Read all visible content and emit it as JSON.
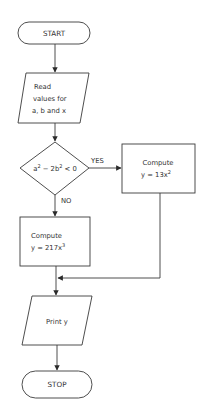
{
  "diagram": {
    "type": "flowchart",
    "stroke_color": "#3a3a3a",
    "background": "#ffffff",
    "nodes": {
      "start": {
        "shape": "terminal",
        "label": "START"
      },
      "read": {
        "shape": "input-output",
        "lines": [
          "Read",
          "values for",
          "a, b and x"
        ]
      },
      "decision": {
        "shape": "decision",
        "expr_a": "a",
        "sup_a": "2",
        "expr_mid": " − 2b",
        "sup_b": "2",
        "expr_end": " < 0"
      },
      "compute_yes": {
        "shape": "process",
        "line1": "Compute",
        "line2": "y = 13x",
        "sup": "2"
      },
      "compute_no": {
        "shape": "process",
        "line1": "Compute",
        "line2": "y = 217x",
        "sup": "3"
      },
      "print": {
        "shape": "input-output",
        "label": "Print y"
      },
      "stop": {
        "shape": "terminal",
        "label": "STOP"
      }
    },
    "edges": {
      "yes_label": "YES",
      "no_label": "NO"
    }
  }
}
